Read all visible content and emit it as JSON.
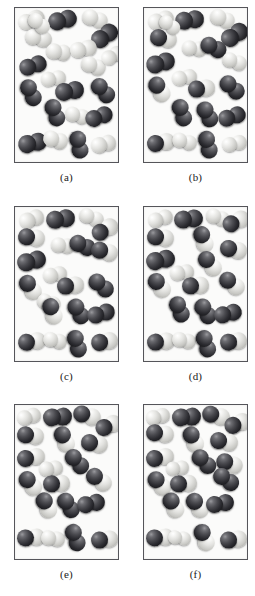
{
  "figure": {
    "background_color": "#ffffff",
    "panel_background_color": "#fbfbfa",
    "panel_border_color": "#55555a",
    "dark_atom_color": "#2b2b30",
    "light_atom_color": "#e2e2df",
    "panel_width": 105,
    "panel_height": 156,
    "columns": [
      14,
      143
    ],
    "row_tops": [
      7,
      206,
      404
    ],
    "label_offset": 8
  },
  "panels": [
    {
      "id": "panel-a",
      "label": "(a)",
      "column": 0,
      "row": 0,
      "counts": {
        "dark_dark": 11,
        "light_light": 11,
        "dark_light": 0
      },
      "molecules": [
        {
          "type": "light-light",
          "x": 3,
          "y": 4,
          "rot": -22,
          "scale": 1.0
        },
        {
          "type": "dark-dark",
          "x": 33,
          "y": 3,
          "rot": -14,
          "scale": 1.1
        },
        {
          "type": "light-light",
          "x": 67,
          "y": 3,
          "rot": 18,
          "scale": 0.98
        },
        {
          "type": "light-light",
          "x": 10,
          "y": 22,
          "rot": 12,
          "scale": 1.0
        },
        {
          "type": "dark-dark",
          "x": 75,
          "y": 19,
          "rot": -36,
          "scale": 1.08
        },
        {
          "type": "light-light",
          "x": 31,
          "y": 36,
          "rot": 8,
          "scale": 0.96
        },
        {
          "type": "light-light",
          "x": 55,
          "y": 33,
          "rot": -12,
          "scale": 1.0
        },
        {
          "type": "dark-dark",
          "x": 4,
          "y": 49,
          "rot": -18,
          "scale": 1.06
        },
        {
          "type": "light-light",
          "x": 66,
          "y": 50,
          "rot": 20,
          "scale": 0.96
        },
        {
          "type": "light-light",
          "x": 26,
          "y": 63,
          "rot": -8,
          "scale": 0.94
        },
        {
          "type": "dark-dark",
          "x": 2,
          "y": 76,
          "rot": 64,
          "scale": 1.04
        },
        {
          "type": "dark-dark",
          "x": 40,
          "y": 74,
          "rot": -10,
          "scale": 1.08
        },
        {
          "type": "dark-dark",
          "x": 74,
          "y": 74,
          "rot": 48,
          "scale": 1.04
        },
        {
          "type": "dark-dark",
          "x": 26,
          "y": 96,
          "rot": 70,
          "scale": 1.04
        },
        {
          "type": "light-light",
          "x": 50,
          "y": 100,
          "rot": 14,
          "scale": 0.94
        },
        {
          "type": "dark-dark",
          "x": 70,
          "y": 100,
          "rot": -20,
          "scale": 1.06
        },
        {
          "type": "dark-dark",
          "x": 3,
          "y": 126,
          "rot": -12,
          "scale": 1.08
        },
        {
          "type": "light-light",
          "x": 28,
          "y": 124,
          "rot": 16,
          "scale": 0.96
        },
        {
          "type": "dark-dark",
          "x": 50,
          "y": 128,
          "rot": 78,
          "scale": 1.04
        },
        {
          "type": "light-light",
          "x": 76,
          "y": 128,
          "rot": -14,
          "scale": 0.96
        },
        {
          "type": "light-light",
          "x": 12,
          "y": 8,
          "rot": 40,
          "scale": 0.9
        },
        {
          "type": "light-light",
          "x": 86,
          "y": 40,
          "rot": -28,
          "scale": 0.92
        }
      ]
    },
    {
      "id": "panel-b",
      "label": "(b)",
      "column": 1,
      "row": 0,
      "counts": {
        "dark_dark": 9,
        "light_light": 8,
        "dark_light": 4
      },
      "molecules": [
        {
          "type": "light-light",
          "x": 4,
          "y": 4,
          "rot": -18,
          "scale": 0.98
        },
        {
          "type": "dark-dark",
          "x": 31,
          "y": 3,
          "rot": -8,
          "scale": 1.1
        },
        {
          "type": "light-light",
          "x": 66,
          "y": 3,
          "rot": 22,
          "scale": 0.96
        },
        {
          "type": "dark-dark",
          "x": 76,
          "y": 18,
          "rot": -34,
          "scale": 1.08
        },
        {
          "type": "dark-light",
          "x": 6,
          "y": 22,
          "rot": 10,
          "scale": 1.02
        },
        {
          "type": "light-light",
          "x": 38,
          "y": 33,
          "rot": 6,
          "scale": 0.94
        },
        {
          "type": "dark-dark",
          "x": 56,
          "y": 31,
          "rot": 26,
          "scale": 1.02
        },
        {
          "type": "dark-dark",
          "x": 2,
          "y": 46,
          "rot": -16,
          "scale": 1.08
        },
        {
          "type": "light-light",
          "x": 78,
          "y": 46,
          "rot": 18,
          "scale": 0.94
        },
        {
          "type": "light-light",
          "x": 28,
          "y": 62,
          "rot": -10,
          "scale": 0.94
        },
        {
          "type": "dark-light",
          "x": 2,
          "y": 73,
          "rot": 58,
          "scale": 1.02
        },
        {
          "type": "dark-light",
          "x": 44,
          "y": 72,
          "rot": -6,
          "scale": 1.02
        },
        {
          "type": "dark-dark",
          "x": 74,
          "y": 71,
          "rot": 42,
          "scale": 1.06
        },
        {
          "type": "dark-dark",
          "x": 24,
          "y": 96,
          "rot": 72,
          "scale": 1.04
        },
        {
          "type": "dark-dark",
          "x": 50,
          "y": 98,
          "rot": 62,
          "scale": 1.02
        },
        {
          "type": "dark-dark",
          "x": 74,
          "y": 100,
          "rot": -18,
          "scale": 1.06
        },
        {
          "type": "dark-light",
          "x": 3,
          "y": 126,
          "rot": -10,
          "scale": 1.06
        },
        {
          "type": "light-light",
          "x": 28,
          "y": 126,
          "rot": 14,
          "scale": 0.94
        },
        {
          "type": "dark-dark",
          "x": 50,
          "y": 128,
          "rot": 76,
          "scale": 1.04
        },
        {
          "type": "light-light",
          "x": 78,
          "y": 128,
          "rot": -12,
          "scale": 0.94
        },
        {
          "type": "light-light",
          "x": 14,
          "y": 10,
          "rot": 36,
          "scale": 0.88
        }
      ]
    },
    {
      "id": "panel-c",
      "label": "(c)",
      "column": 0,
      "row": 1,
      "counts": {
        "dark_dark": 7,
        "light_light": 6,
        "dark_light": 8
      },
      "molecules": [
        {
          "type": "light-light",
          "x": 4,
          "y": 4,
          "rot": -20,
          "scale": 0.96
        },
        {
          "type": "dark-dark",
          "x": 31,
          "y": 3,
          "rot": -8,
          "scale": 1.1
        },
        {
          "type": "light-light",
          "x": 64,
          "y": 3,
          "rot": 20,
          "scale": 0.94
        },
        {
          "type": "dark-light",
          "x": 76,
          "y": 14,
          "rot": -30,
          "scale": 1.06
        },
        {
          "type": "dark-light",
          "x": 3,
          "y": 22,
          "rot": 8,
          "scale": 1.02
        },
        {
          "type": "light-light",
          "x": 36,
          "y": 31,
          "rot": 6,
          "scale": 0.92
        },
        {
          "type": "dark-dark",
          "x": 54,
          "y": 30,
          "rot": 24,
          "scale": 1.02
        },
        {
          "type": "dark-light",
          "x": 76,
          "y": 36,
          "rot": 14,
          "scale": 1.02
        },
        {
          "type": "dark-dark",
          "x": 2,
          "y": 45,
          "rot": -14,
          "scale": 1.08
        },
        {
          "type": "light-light",
          "x": 28,
          "y": 60,
          "rot": -10,
          "scale": 0.92
        },
        {
          "type": "dark-light",
          "x": 2,
          "y": 72,
          "rot": 54,
          "scale": 1.02
        },
        {
          "type": "dark-light",
          "x": 42,
          "y": 70,
          "rot": -6,
          "scale": 1.02
        },
        {
          "type": "dark-dark",
          "x": 72,
          "y": 70,
          "rot": 40,
          "scale": 1.06
        },
        {
          "type": "light-light",
          "x": 22,
          "y": 88,
          "rot": 18,
          "scale": 0.9
        },
        {
          "type": "dark-light",
          "x": 24,
          "y": 96,
          "rot": 70,
          "scale": 1.02
        },
        {
          "type": "dark-dark",
          "x": 50,
          "y": 96,
          "rot": 60,
          "scale": 1.02
        },
        {
          "type": "dark-dark",
          "x": 72,
          "y": 98,
          "rot": -16,
          "scale": 1.06
        },
        {
          "type": "dark-light",
          "x": 3,
          "y": 126,
          "rot": -8,
          "scale": 1.06
        },
        {
          "type": "light-light",
          "x": 28,
          "y": 126,
          "rot": 12,
          "scale": 0.92
        },
        {
          "type": "dark-dark",
          "x": 48,
          "y": 128,
          "rot": 74,
          "scale": 1.04
        },
        {
          "type": "dark-light",
          "x": 76,
          "y": 126,
          "rot": -10,
          "scale": 1.02
        }
      ]
    },
    {
      "id": "panel-d",
      "label": "(d)",
      "column": 1,
      "row": 1,
      "counts": {
        "dark_dark": 6,
        "light_light": 4,
        "dark_light": 11
      },
      "molecules": [
        {
          "type": "light-light",
          "x": 4,
          "y": 4,
          "rot": -18,
          "scale": 0.94
        },
        {
          "type": "dark-dark",
          "x": 30,
          "y": 3,
          "rot": -6,
          "scale": 1.1
        },
        {
          "type": "light-light",
          "x": 62,
          "y": 3,
          "rot": 18,
          "scale": 0.92
        },
        {
          "type": "dark-light",
          "x": 78,
          "y": 6,
          "rot": -26,
          "scale": 1.04
        },
        {
          "type": "dark-light",
          "x": 3,
          "y": 22,
          "rot": 8,
          "scale": 1.02
        },
        {
          "type": "dark-light",
          "x": 46,
          "y": 24,
          "rot": 70,
          "scale": 1.02
        },
        {
          "type": "dark-light",
          "x": 76,
          "y": 34,
          "rot": 12,
          "scale": 1.02
        },
        {
          "type": "dark-dark",
          "x": 2,
          "y": 44,
          "rot": -12,
          "scale": 1.08
        },
        {
          "type": "dark-light",
          "x": 52,
          "y": 48,
          "rot": 50,
          "scale": 1.04
        },
        {
          "type": "light-light",
          "x": 26,
          "y": 58,
          "rot": -8,
          "scale": 0.9
        },
        {
          "type": "dark-light",
          "x": 2,
          "y": 70,
          "rot": 52,
          "scale": 1.02
        },
        {
          "type": "dark-light",
          "x": 38,
          "y": 70,
          "rot": -4,
          "scale": 1.02
        },
        {
          "type": "dark-light",
          "x": 74,
          "y": 68,
          "rot": 38,
          "scale": 1.04
        },
        {
          "type": "dark-dark",
          "x": 22,
          "y": 94,
          "rot": 68,
          "scale": 1.02
        },
        {
          "type": "dark-dark",
          "x": 48,
          "y": 96,
          "rot": 58,
          "scale": 1.02
        },
        {
          "type": "dark-dark",
          "x": 70,
          "y": 98,
          "rot": -14,
          "scale": 1.06
        },
        {
          "type": "dark-light",
          "x": 3,
          "y": 126,
          "rot": -6,
          "scale": 1.06
        },
        {
          "type": "light-light",
          "x": 28,
          "y": 126,
          "rot": 10,
          "scale": 0.9
        },
        {
          "type": "dark-dark",
          "x": 48,
          "y": 128,
          "rot": 72,
          "scale": 1.04
        },
        {
          "type": "dark-light",
          "x": 76,
          "y": 126,
          "rot": -8,
          "scale": 1.02
        }
      ]
    },
    {
      "id": "panel-e",
      "label": "(e)",
      "column": 0,
      "row": 2,
      "counts": {
        "dark_dark": 5,
        "light_light": 3,
        "dark_light": 13
      },
      "molecules": [
        {
          "type": "light-light",
          "x": 2,
          "y": 4,
          "rot": -16,
          "scale": 0.92
        },
        {
          "type": "dark-dark",
          "x": 28,
          "y": 3,
          "rot": -4,
          "scale": 1.1
        },
        {
          "type": "dark-light",
          "x": 58,
          "y": 2,
          "rot": 16,
          "scale": 1.06
        },
        {
          "type": "dark-light",
          "x": 80,
          "y": 12,
          "rot": -24,
          "scale": 1.02
        },
        {
          "type": "dark-light",
          "x": 2,
          "y": 22,
          "rot": 8,
          "scale": 1.02
        },
        {
          "type": "dark-light",
          "x": 36,
          "y": 26,
          "rot": 66,
          "scale": 1.02
        },
        {
          "type": "dark-light",
          "x": 66,
          "y": 30,
          "rot": 10,
          "scale": 1.02
        },
        {
          "type": "dark-light",
          "x": 2,
          "y": 44,
          "rot": -10,
          "scale": 1.04
        },
        {
          "type": "dark-dark",
          "x": 48,
          "y": 48,
          "rot": 48,
          "scale": 1.04
        },
        {
          "type": "light-light",
          "x": 24,
          "y": 56,
          "rot": -6,
          "scale": 0.9
        },
        {
          "type": "dark-light",
          "x": 2,
          "y": 70,
          "rot": 50,
          "scale": 1.02
        },
        {
          "type": "dark-light",
          "x": 28,
          "y": 70,
          "rot": -4,
          "scale": 1.02
        },
        {
          "type": "dark-light",
          "x": 70,
          "y": 66,
          "rot": 36,
          "scale": 1.04
        },
        {
          "type": "dark-light",
          "x": 18,
          "y": 92,
          "rot": 64,
          "scale": 1.02
        },
        {
          "type": "dark-dark",
          "x": 40,
          "y": 92,
          "rot": 56,
          "scale": 1.02
        },
        {
          "type": "dark-dark",
          "x": 62,
          "y": 90,
          "rot": -12,
          "scale": 1.06
        },
        {
          "type": "dark-light",
          "x": 2,
          "y": 124,
          "rot": -4,
          "scale": 1.06
        },
        {
          "type": "light-light",
          "x": 26,
          "y": 126,
          "rot": 8,
          "scale": 0.9
        },
        {
          "type": "dark-dark",
          "x": 46,
          "y": 124,
          "rot": 70,
          "scale": 1.06
        },
        {
          "type": "dark-light",
          "x": 76,
          "y": 126,
          "rot": -6,
          "scale": 1.02
        }
      ]
    },
    {
      "id": "panel-f",
      "label": "(f)",
      "column": 1,
      "row": 2,
      "counts": {
        "dark_dark": 4,
        "light_light": 3,
        "dark_light": 14
      },
      "molecules": [
        {
          "type": "light-light",
          "x": 2,
          "y": 4,
          "rot": -14,
          "scale": 0.92
        },
        {
          "type": "dark-dark",
          "x": 28,
          "y": 3,
          "rot": -4,
          "scale": 1.1
        },
        {
          "type": "dark-light",
          "x": 58,
          "y": 2,
          "rot": 14,
          "scale": 1.06
        },
        {
          "type": "dark-light",
          "x": 80,
          "y": 10,
          "rot": -22,
          "scale": 1.02
        },
        {
          "type": "dark-light",
          "x": 2,
          "y": 20,
          "rot": 8,
          "scale": 1.04
        },
        {
          "type": "dark-light",
          "x": 36,
          "y": 26,
          "rot": 64,
          "scale": 1.02
        },
        {
          "type": "dark-light",
          "x": 66,
          "y": 28,
          "rot": 10,
          "scale": 1.04
        },
        {
          "type": "dark-light",
          "x": 2,
          "y": 44,
          "rot": -10,
          "scale": 1.04
        },
        {
          "type": "dark-dark",
          "x": 46,
          "y": 48,
          "rot": 46,
          "scale": 1.04
        },
        {
          "type": "dark-light",
          "x": 72,
          "y": 50,
          "rot": 20,
          "scale": 1.02
        },
        {
          "type": "light-light",
          "x": 22,
          "y": 56,
          "rot": -6,
          "scale": 0.88
        },
        {
          "type": "dark-light",
          "x": 2,
          "y": 70,
          "rot": 48,
          "scale": 1.02
        },
        {
          "type": "dark-light",
          "x": 26,
          "y": 70,
          "rot": -4,
          "scale": 1.02
        },
        {
          "type": "dark-dark",
          "x": 68,
          "y": 66,
          "rot": 34,
          "scale": 1.06
        },
        {
          "type": "dark-light",
          "x": 16,
          "y": 92,
          "rot": 62,
          "scale": 1.02
        },
        {
          "type": "dark-light",
          "x": 40,
          "y": 92,
          "rot": 54,
          "scale": 1.02
        },
        {
          "type": "dark-dark",
          "x": 62,
          "y": 90,
          "rot": -10,
          "scale": 1.06
        },
        {
          "type": "dark-light",
          "x": 2,
          "y": 124,
          "rot": -4,
          "scale": 1.06
        },
        {
          "type": "light-light",
          "x": 24,
          "y": 126,
          "rot": 8,
          "scale": 0.88
        },
        {
          "type": "dark-light",
          "x": 46,
          "y": 124,
          "rot": 68,
          "scale": 1.06
        },
        {
          "type": "dark-light",
          "x": 76,
          "y": 126,
          "rot": -6,
          "scale": 1.02
        }
      ]
    }
  ]
}
